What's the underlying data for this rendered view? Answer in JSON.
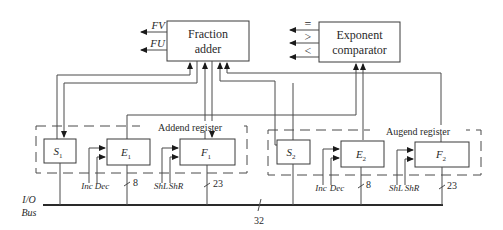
{
  "diagram": {
    "type": "block-diagram",
    "fraction_adder": {
      "line1": "Fraction",
      "line2": "adder",
      "outputs": [
        "FV",
        "FU"
      ]
    },
    "exponent_comparator": {
      "line1": "Exponent",
      "line2": "comparator",
      "outputs": [
        "=",
        ">",
        "<"
      ]
    },
    "addend_register": {
      "label": "Addend register",
      "sign": {
        "name": "S",
        "sub": "1"
      },
      "exponent": {
        "name": "E",
        "sub": "1",
        "controls": [
          "Inc",
          "Dec"
        ],
        "width": "8"
      },
      "fraction": {
        "name": "F",
        "sub": "1",
        "controls": [
          "ShL",
          "ShR"
        ],
        "width": "23"
      }
    },
    "augend_register": {
      "label": "Augend register",
      "sign": {
        "name": "S",
        "sub": "2"
      },
      "exponent": {
        "name": "E",
        "sub": "2",
        "controls": [
          "Inc",
          "Dec"
        ],
        "width": "8"
      },
      "fraction": {
        "name": "F",
        "sub": "2",
        "controls": [
          "ShL",
          "ShR"
        ],
        "width": "23"
      }
    },
    "bus": {
      "line1": "I/O",
      "line2": "Bus",
      "width": "32"
    }
  }
}
